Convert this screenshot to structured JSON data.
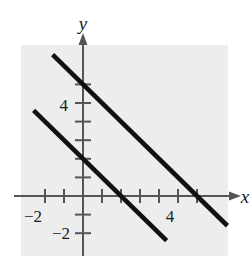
{
  "figure": {
    "background_color": "#ffffff",
    "plot_area_color": "#ededed",
    "axis_color": "#555555",
    "line_color": "#111111"
  },
  "axes": {
    "x_axis_label": "x",
    "y_axis_label": "y",
    "x_tick_labels": [
      {
        "value": -2,
        "text": "−2"
      },
      {
        "value": 4,
        "text": "4"
      }
    ],
    "y_tick_labels": [
      {
        "value": 4,
        "text": "4"
      },
      {
        "value": -2,
        "text": "−2"
      }
    ],
    "xlim": [
      -3.3,
      7.7
    ],
    "ylim": [
      -3.2,
      8.4
    ],
    "x_ticks": [
      -2,
      -1,
      1,
      2,
      3,
      4,
      5,
      6
    ],
    "y_ticks": [
      -2,
      -1,
      1,
      2,
      3,
      4,
      5,
      6
    ],
    "arrows": [
      "x-positive",
      "y-positive"
    ]
  },
  "chart_data": {
    "type": "line",
    "title": "",
    "xlabel": "x",
    "ylabel": "y",
    "grid": false,
    "legend": "none",
    "xlim": [
      -3.3,
      7.7
    ],
    "ylim": [
      -3.2,
      8.4
    ],
    "series": [
      {
        "name": "upper-line",
        "slope": -1,
        "intercept": 6,
        "x_intercept": 6,
        "y_intercept": 6,
        "points": [
          [
            -1.6,
            7.6
          ],
          [
            7.6,
            -1.6
          ]
        ],
        "color": "#111111"
      },
      {
        "name": "lower-line",
        "slope": -1,
        "intercept": 2,
        "x_intercept": 2,
        "y_intercept": 2,
        "points": [
          [
            -2.6,
            4.6
          ],
          [
            4.4,
            -2.4
          ]
        ],
        "color": "#111111"
      }
    ]
  }
}
